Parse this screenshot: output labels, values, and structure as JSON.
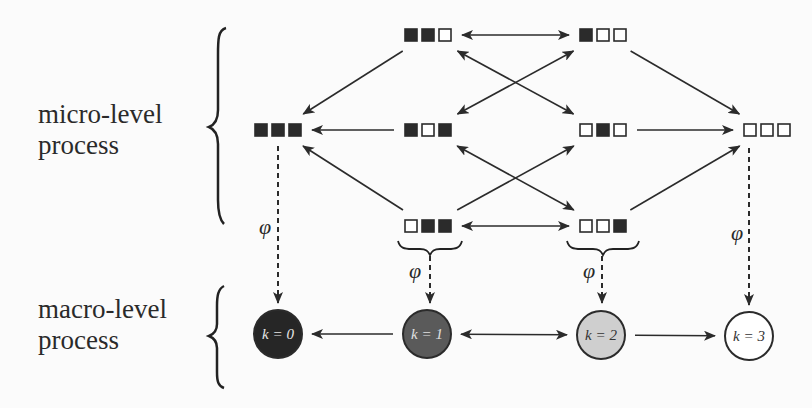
{
  "labels": {
    "micro": [
      "micro-level",
      "process"
    ],
    "macro": [
      "macro-level",
      "process"
    ]
  },
  "mapping_symbol": "φ",
  "colors": {
    "filled_square": "#2b2b2b",
    "empty_square": "#ffffff",
    "line": "#2b2b2b",
    "k0": "#262626",
    "k1": "#5a5a5a",
    "k2": "#cfcfcf",
    "k3": "#ffffff"
  },
  "micro_states": [
    {
      "id": "110",
      "bits": [
        1,
        1,
        0
      ],
      "x": 428,
      "y": 35
    },
    {
      "id": "100",
      "bits": [
        1,
        0,
        0
      ],
      "x": 603,
      "y": 35
    },
    {
      "id": "111",
      "bits": [
        1,
        1,
        1
      ],
      "x": 278,
      "y": 130
    },
    {
      "id": "101",
      "bits": [
        1,
        0,
        1
      ],
      "x": 428,
      "y": 130
    },
    {
      "id": "010",
      "bits": [
        0,
        1,
        0
      ],
      "x": 603,
      "y": 130
    },
    {
      "id": "000",
      "bits": [
        0,
        0,
        0
      ],
      "x": 767,
      "y": 130
    },
    {
      "id": "011",
      "bits": [
        0,
        1,
        1
      ],
      "x": 428,
      "y": 226
    },
    {
      "id": "001",
      "bits": [
        0,
        0,
        1
      ],
      "x": 603,
      "y": 226
    }
  ],
  "micro_transitions": [
    {
      "from": "110",
      "to": "100",
      "bidirectional": true
    },
    {
      "from": "110",
      "to": "111",
      "bidirectional": false
    },
    {
      "from": "110",
      "to": "010",
      "bidirectional": true
    },
    {
      "from": "101",
      "to": "100",
      "bidirectional": true
    },
    {
      "from": "100",
      "to": "000",
      "bidirectional": false
    },
    {
      "from": "101",
      "to": "111",
      "bidirectional": false
    },
    {
      "from": "010",
      "to": "000",
      "bidirectional": false
    },
    {
      "from": "011",
      "to": "111",
      "bidirectional": false
    },
    {
      "from": "011",
      "to": "010",
      "bidirectional": false
    },
    {
      "from": "101",
      "to": "001",
      "bidirectional": true
    },
    {
      "from": "011",
      "to": "001",
      "bidirectional": true
    },
    {
      "from": "001",
      "to": "000",
      "bidirectional": false
    }
  ],
  "macro_states": [
    {
      "id": "k0",
      "label": "k = 0",
      "x": 278,
      "y": 334,
      "fill": "#262626",
      "text": "#e6e6e6"
    },
    {
      "id": "k1",
      "label": "k = 1",
      "x": 427,
      "y": 334,
      "fill": "#5a5a5a",
      "text": "#e0e0e0"
    },
    {
      "id": "k2",
      "label": "k = 2",
      "x": 601,
      "y": 335,
      "fill": "#cfcfcf",
      "text": "#333333"
    },
    {
      "id": "k3",
      "label": "k = 3",
      "x": 749,
      "y": 336,
      "fill": "#ffffff",
      "text": "#333333"
    }
  ],
  "macro_transitions": [
    {
      "from": "k1",
      "to": "k0",
      "bidirectional": false
    },
    {
      "from": "k1",
      "to": "k2",
      "bidirectional": true
    },
    {
      "from": "k2",
      "to": "k3",
      "bidirectional": false
    }
  ]
}
